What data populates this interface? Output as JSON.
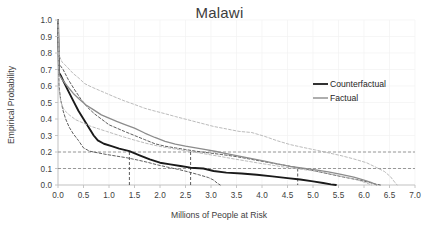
{
  "chart": {
    "title": "Malawi",
    "xlabel": "Millions of People at Risk",
    "ylabel": "Empirical Probability",
    "legend": {
      "counterfactual": "Counterfactual",
      "factual": "Factual"
    },
    "xticks": [
      "0.0",
      "0.5",
      "1.0",
      "1.5",
      "2.0",
      "2.5",
      "3.0",
      "3.5",
      "4.0",
      "4.5",
      "5.0",
      "5.5",
      "6.0",
      "6.5",
      "7.0"
    ],
    "yticks": [
      "0.0",
      "0.1",
      "0.2",
      "0.3",
      "0.4",
      "0.5",
      "0.6",
      "0.7",
      "0.8",
      "0.9",
      "1.0"
    ],
    "colors": {
      "counterfactual": "#1a1a1a",
      "factual": "#8c8c8c",
      "counterfactual_band": "#4d4d4d",
      "factual_band": "#b3b3b3",
      "reference_line": "#808080",
      "axis": "#bfbfbf",
      "grid": "#f2f2f2"
    }
  },
  "chart_data": {
    "type": "line",
    "title": "Malawi",
    "xlabel": "Millions of People at Risk",
    "ylabel": "Empirical Probability",
    "xlim": [
      0.0,
      7.0
    ],
    "ylim": [
      0.0,
      1.0
    ],
    "xticks": [
      0.0,
      0.5,
      1.0,
      1.5,
      2.0,
      2.5,
      3.0,
      3.5,
      4.0,
      4.5,
      5.0,
      5.5,
      6.0,
      6.5,
      7.0
    ],
    "yticks": [
      0.0,
      0.1,
      0.2,
      0.3,
      0.4,
      0.5,
      0.6,
      0.7,
      0.8,
      0.9,
      1.0
    ],
    "grid": true,
    "legend_position": "upper right",
    "series": [
      {
        "name": "Counterfactual",
        "style": "solid",
        "color": "#1a1a1a",
        "points": [
          [
            0.0,
            1.0
          ],
          [
            0.02,
            0.68
          ],
          [
            0.06,
            0.66
          ],
          [
            0.12,
            0.62
          ],
          [
            0.2,
            0.57
          ],
          [
            0.3,
            0.51
          ],
          [
            0.4,
            0.45
          ],
          [
            0.5,
            0.4
          ],
          [
            0.6,
            0.35
          ],
          [
            0.7,
            0.3
          ],
          [
            0.78,
            0.27
          ],
          [
            0.9,
            0.25
          ],
          [
            1.05,
            0.235
          ],
          [
            1.2,
            0.22
          ],
          [
            1.4,
            0.205
          ],
          [
            1.6,
            0.18
          ],
          [
            1.8,
            0.155
          ],
          [
            2.0,
            0.135
          ],
          [
            2.2,
            0.125
          ],
          [
            2.4,
            0.115
          ],
          [
            2.6,
            0.105
          ],
          [
            2.85,
            0.1
          ],
          [
            3.05,
            0.085
          ],
          [
            3.3,
            0.075
          ],
          [
            3.6,
            0.07
          ],
          [
            3.9,
            0.062
          ],
          [
            4.2,
            0.052
          ],
          [
            4.5,
            0.042
          ],
          [
            4.75,
            0.033
          ],
          [
            5.0,
            0.022
          ],
          [
            5.2,
            0.012
          ],
          [
            5.35,
            0.004
          ],
          [
            5.45,
            0.0
          ]
        ]
      },
      {
        "name": "Counterfactual upper bound",
        "style": "dashed",
        "color": "#4d4d4d",
        "points": [
          [
            0.0,
            1.0
          ],
          [
            0.03,
            0.73
          ],
          [
            0.1,
            0.7
          ],
          [
            0.2,
            0.64
          ],
          [
            0.32,
            0.58
          ],
          [
            0.45,
            0.52
          ],
          [
            0.58,
            0.47
          ],
          [
            0.72,
            0.43
          ],
          [
            0.85,
            0.4
          ],
          [
            1.0,
            0.365
          ],
          [
            1.15,
            0.345
          ],
          [
            1.3,
            0.325
          ],
          [
            1.5,
            0.3
          ],
          [
            1.7,
            0.275
          ],
          [
            1.9,
            0.25
          ],
          [
            2.1,
            0.235
          ],
          [
            2.3,
            0.225
          ],
          [
            2.5,
            0.215
          ],
          [
            2.7,
            0.205
          ],
          [
            2.95,
            0.195
          ],
          [
            3.2,
            0.185
          ],
          [
            3.5,
            0.172
          ],
          [
            3.8,
            0.155
          ],
          [
            4.1,
            0.138
          ],
          [
            4.4,
            0.122
          ],
          [
            4.7,
            0.105
          ],
          [
            5.0,
            0.088
          ],
          [
            5.3,
            0.068
          ],
          [
            5.6,
            0.048
          ],
          [
            5.9,
            0.03
          ],
          [
            6.1,
            0.016
          ],
          [
            6.25,
            0.004
          ],
          [
            6.32,
            0.0
          ]
        ]
      },
      {
        "name": "Counterfactual lower bound",
        "style": "dashed",
        "color": "#4d4d4d",
        "points": [
          [
            0.0,
            0.98
          ],
          [
            0.02,
            0.6
          ],
          [
            0.05,
            0.52
          ],
          [
            0.1,
            0.45
          ],
          [
            0.15,
            0.4
          ],
          [
            0.22,
            0.35
          ],
          [
            0.3,
            0.31
          ],
          [
            0.4,
            0.27
          ],
          [
            0.5,
            0.225
          ],
          [
            0.62,
            0.205
          ],
          [
            0.78,
            0.195
          ],
          [
            0.95,
            0.185
          ],
          [
            1.15,
            0.175
          ],
          [
            1.35,
            0.165
          ],
          [
            1.55,
            0.152
          ],
          [
            1.75,
            0.138
          ],
          [
            1.95,
            0.122
          ],
          [
            2.15,
            0.108
          ],
          [
            2.35,
            0.095
          ],
          [
            2.55,
            0.08
          ],
          [
            2.75,
            0.063
          ],
          [
            2.95,
            0.045
          ],
          [
            3.05,
            0.03
          ],
          [
            3.12,
            0.012
          ],
          [
            3.18,
            0.0
          ]
        ]
      },
      {
        "name": "Factual",
        "style": "solid",
        "color": "#8c8c8c",
        "points": [
          [
            0.0,
            1.0
          ],
          [
            0.02,
            0.67
          ],
          [
            0.08,
            0.64
          ],
          [
            0.18,
            0.6
          ],
          [
            0.3,
            0.555
          ],
          [
            0.42,
            0.52
          ],
          [
            0.55,
            0.485
          ],
          [
            0.7,
            0.455
          ],
          [
            0.85,
            0.425
          ],
          [
            1.0,
            0.405
          ],
          [
            1.15,
            0.385
          ],
          [
            1.3,
            0.368
          ],
          [
            1.5,
            0.345
          ],
          [
            1.7,
            0.315
          ],
          [
            1.9,
            0.288
          ],
          [
            2.1,
            0.265
          ],
          [
            2.3,
            0.248
          ],
          [
            2.5,
            0.235
          ],
          [
            2.7,
            0.225
          ],
          [
            2.9,
            0.215
          ],
          [
            3.1,
            0.203
          ],
          [
            3.3,
            0.19
          ],
          [
            3.55,
            0.175
          ],
          [
            3.8,
            0.16
          ],
          [
            4.05,
            0.145
          ],
          [
            4.3,
            0.128
          ],
          [
            4.55,
            0.113
          ],
          [
            4.8,
            0.102
          ],
          [
            5.05,
            0.092
          ],
          [
            5.3,
            0.08
          ],
          [
            5.55,
            0.065
          ],
          [
            5.8,
            0.048
          ],
          [
            6.0,
            0.03
          ],
          [
            6.15,
            0.014
          ],
          [
            6.25,
            0.0
          ]
        ]
      },
      {
        "name": "Factual upper bound",
        "style": "dashed",
        "color": "#b3b3b3",
        "points": [
          [
            0.0,
            1.0
          ],
          [
            0.03,
            0.78
          ],
          [
            0.08,
            0.745
          ],
          [
            0.18,
            0.715
          ],
          [
            0.3,
            0.675
          ],
          [
            0.42,
            0.645
          ],
          [
            0.52,
            0.615
          ],
          [
            0.65,
            0.595
          ],
          [
            0.8,
            0.575
          ],
          [
            0.95,
            0.555
          ],
          [
            1.1,
            0.535
          ],
          [
            1.3,
            0.51
          ],
          [
            1.5,
            0.488
          ],
          [
            1.7,
            0.465
          ],
          [
            1.9,
            0.448
          ],
          [
            2.1,
            0.432
          ],
          [
            2.3,
            0.415
          ],
          [
            2.55,
            0.395
          ],
          [
            2.8,
            0.375
          ],
          [
            3.05,
            0.355
          ],
          [
            3.3,
            0.34
          ],
          [
            3.55,
            0.325
          ],
          [
            3.8,
            0.318
          ],
          [
            4.05,
            0.295
          ],
          [
            4.3,
            0.268
          ],
          [
            4.55,
            0.245
          ],
          [
            4.8,
            0.228
          ],
          [
            5.05,
            0.212
          ],
          [
            5.3,
            0.195
          ],
          [
            5.55,
            0.178
          ],
          [
            5.8,
            0.158
          ],
          [
            6.05,
            0.135
          ],
          [
            6.25,
            0.105
          ],
          [
            6.4,
            0.082
          ],
          [
            6.52,
            0.05
          ],
          [
            6.6,
            0.018
          ],
          [
            6.65,
            0.0
          ]
        ]
      },
      {
        "name": "Factual lower bound",
        "style": "dashed",
        "color": "#b3b3b3",
        "points": [
          [
            0.0,
            0.97
          ],
          [
            0.02,
            0.58
          ],
          [
            0.06,
            0.5
          ],
          [
            0.12,
            0.455
          ],
          [
            0.22,
            0.425
          ],
          [
            0.35,
            0.395
          ],
          [
            0.5,
            0.375
          ],
          [
            0.65,
            0.355
          ],
          [
            0.8,
            0.34
          ],
          [
            0.95,
            0.325
          ],
          [
            1.1,
            0.31
          ],
          [
            1.3,
            0.29
          ],
          [
            1.5,
            0.272
          ],
          [
            1.7,
            0.255
          ],
          [
            1.9,
            0.24
          ],
          [
            2.1,
            0.228
          ],
          [
            2.3,
            0.218
          ],
          [
            2.5,
            0.208
          ],
          [
            2.7,
            0.198
          ],
          [
            2.95,
            0.185
          ],
          [
            3.2,
            0.172
          ],
          [
            3.45,
            0.158
          ],
          [
            3.7,
            0.145
          ],
          [
            3.95,
            0.132
          ],
          [
            4.2,
            0.12
          ],
          [
            4.45,
            0.108
          ],
          [
            4.7,
            0.098
          ],
          [
            4.95,
            0.088
          ],
          [
            5.2,
            0.075
          ],
          [
            5.45,
            0.06
          ],
          [
            5.7,
            0.044
          ],
          [
            5.9,
            0.028
          ],
          [
            6.05,
            0.012
          ],
          [
            6.15,
            0.0
          ]
        ]
      }
    ],
    "reference_lines": [
      {
        "orientation": "horizontal",
        "value": 0.2
      },
      {
        "orientation": "horizontal",
        "value": 0.1
      },
      {
        "orientation": "vertical",
        "value": 1.4,
        "from": 0.0,
        "to": 0.2
      },
      {
        "orientation": "vertical",
        "value": 2.6,
        "from": 0.0,
        "to": 0.2
      },
      {
        "orientation": "vertical",
        "value": 4.7,
        "from": 0.0,
        "to": 0.1
      }
    ],
    "annotations": []
  }
}
